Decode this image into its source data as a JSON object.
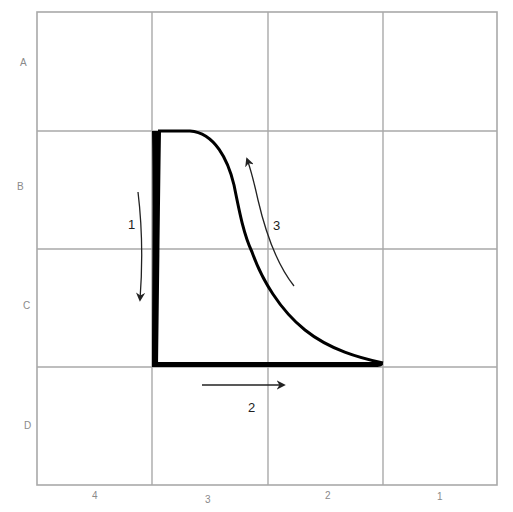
{
  "grid": {
    "rows": [
      "A",
      "B",
      "C",
      "D"
    ],
    "columns": [
      "4",
      "3",
      "2",
      "1"
    ],
    "grid_color": "#a9a9a9",
    "label_color": "#8a8a8a"
  },
  "cycle": {
    "stroke_color": "#000000",
    "segments": [
      {
        "id": "vertical-thick-edge",
        "description": "thick near-vertical line from top-left corner down to bottom-left corner"
      },
      {
        "id": "bottom-thick-edge",
        "description": "thick horizontal line from bottom-left corner to bottom-right tip"
      },
      {
        "id": "curved-edge",
        "description": "curve rising from bottom-right tip back up to top-left corner"
      }
    ]
  },
  "arrows": [
    {
      "id": "arrow-1",
      "label": "1",
      "direction": "down"
    },
    {
      "id": "arrow-2",
      "label": "2",
      "direction": "right"
    },
    {
      "id": "arrow-3",
      "label": "3",
      "direction": "up-left"
    }
  ]
}
